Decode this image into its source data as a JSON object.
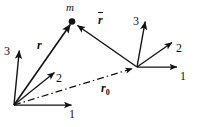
{
  "figure": {
    "background_color": "#ffffff",
    "stroke_color": "#111111",
    "width": 203,
    "height": 127
  },
  "labels": {
    "mass_point": "m",
    "vector_r": "r",
    "vector_rbar": "r",
    "vector_r0": "r",
    "vector_r0_subscript": "0"
  },
  "frame_left": {
    "name": "left-coordinate-frame",
    "origin": [
      14,
      105
    ],
    "axis_1_label": "1",
    "axis_2_label": "2",
    "axis_3_label": "3",
    "axis_1_tip": [
      75,
      105
    ],
    "axis_2_tip": [
      57,
      70
    ],
    "axis_3_tip": [
      20,
      47
    ]
  },
  "frame_right": {
    "name": "right-coordinate-frame",
    "origin": [
      137,
      67
    ],
    "axis_1_label": "1",
    "axis_2_label": "2",
    "axis_3_label": "3",
    "axis_1_tip": [
      180,
      67
    ],
    "axis_2_tip": [
      175,
      40
    ],
    "axis_3_tip": [
      146,
      18
    ]
  },
  "vectors": {
    "r": {
      "from": [
        14,
        105
      ],
      "to": [
        72,
        21
      ],
      "style": "solid",
      "bold": true
    },
    "rbar": {
      "from": [
        137,
        67
      ],
      "to": [
        75,
        23
      ],
      "style": "solid",
      "bold": false
    },
    "r0": {
      "from": [
        14,
        105
      ],
      "to": [
        137,
        67
      ],
      "style": "dash-dot",
      "bold": false
    }
  },
  "mass": {
    "point": [
      72,
      21
    ],
    "radius": 3.2
  }
}
